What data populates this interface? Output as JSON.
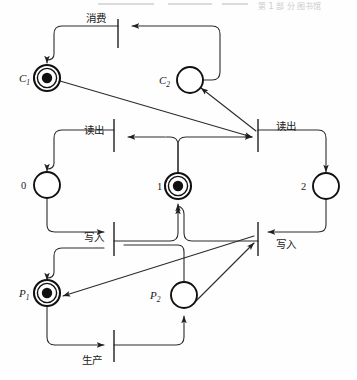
{
  "figure": {
    "type": "petri-net",
    "title": "",
    "colors": {
      "stroke": "#111111",
      "line": "#2b2b2b",
      "background": "#fefefe",
      "token": "#111111"
    }
  },
  "places": [
    {
      "id": "C1",
      "label": "C",
      "subscript": "1",
      "label_side": "left",
      "tokens": 1,
      "style": "double",
      "cx": 47,
      "cy": 78,
      "r": 13
    },
    {
      "id": "C2",
      "label": "C",
      "subscript": "2",
      "label_side": "left",
      "tokens": 0,
      "style": "single",
      "cx": 190,
      "cy": 80,
      "r": 13
    },
    {
      "id": "B0",
      "label": "0",
      "subscript": "",
      "label_side": "left",
      "tokens": 0,
      "style": "single",
      "cx": 47,
      "cy": 185,
      "r": 13
    },
    {
      "id": "B1",
      "label": "1",
      "subscript": "",
      "label_side": "left",
      "tokens": 1,
      "style": "double",
      "cx": 178,
      "cy": 186,
      "r": 13
    },
    {
      "id": "B2",
      "label": "2",
      "subscript": "",
      "label_side": "left",
      "tokens": 0,
      "style": "single",
      "cx": 326,
      "cy": 186,
      "r": 13
    },
    {
      "id": "P1",
      "label": "P",
      "subscript": "1",
      "label_side": "left",
      "tokens": 1,
      "style": "double",
      "cx": 47,
      "cy": 293,
      "r": 13
    },
    {
      "id": "P2",
      "label": "P",
      "subscript": "2",
      "label_side": "left",
      "tokens": 0,
      "style": "single",
      "cx": 184,
      "cy": 295,
      "r": 13
    }
  ],
  "transitions": [
    {
      "id": "t-consume",
      "label": "消费",
      "label_pos": "left-above",
      "x": 118,
      "y_top": 19,
      "y_bottom": 48,
      "label_x": 96,
      "label_y": 22
    },
    {
      "id": "t-read-left",
      "label": "读出",
      "label_pos": "left",
      "x": 114,
      "y_top": 119,
      "y_bottom": 152,
      "label_x": 94,
      "label_y": 133
    },
    {
      "id": "t-read-right",
      "label": "读出",
      "label_pos": "right",
      "x": 258,
      "y_top": 119,
      "y_bottom": 152,
      "label_x": 268,
      "label_y": 129
    },
    {
      "id": "t-write-left",
      "label": "写入",
      "label_pos": "left",
      "x": 114,
      "y_top": 222,
      "y_bottom": 256,
      "label_x": 94,
      "label_y": 240
    },
    {
      "id": "t-write-right",
      "label": "写入",
      "label_pos": "right",
      "x": 258,
      "y_top": 222,
      "y_bottom": 256,
      "label_x": 268,
      "label_y": 247
    },
    {
      "id": "t-produce",
      "label": "生产",
      "label_pos": "left-below",
      "x": 114,
      "y_top": 330,
      "y_bottom": 362,
      "label_x": 92,
      "label_y": 361
    }
  ],
  "arcs": [
    {
      "id": "arc-c2-to-consume",
      "from": "C2",
      "to": "t-consume"
    },
    {
      "id": "arc-consume-to-c1",
      "from": "t-consume",
      "to": "C1"
    },
    {
      "id": "arc-c1-to-readright",
      "from": "C1",
      "to": "t-read-right"
    },
    {
      "id": "arc-readright-to-c2",
      "from": "t-read-right",
      "to": "C2"
    },
    {
      "id": "arc-b1-to-readleft",
      "from": "B1",
      "to": "t-read-left"
    },
    {
      "id": "arc-readleft-to-b0",
      "from": "t-read-left",
      "to": "B0"
    },
    {
      "id": "arc-b1-to-readright-path",
      "from": "B1",
      "to": "t-read-right"
    },
    {
      "id": "arc-readright-to-b2",
      "from": "t-read-right",
      "to": "B2"
    },
    {
      "id": "arc-b0-to-writeleft",
      "from": "B0",
      "to": "t-write-left"
    },
    {
      "id": "arc-writeleft-to-b1",
      "from": "t-write-left",
      "to": "B1"
    },
    {
      "id": "arc-b2-to-writeright",
      "from": "B2",
      "to": "t-write-right"
    },
    {
      "id": "arc-writeright-to-b1",
      "from": "t-write-right",
      "to": "B1"
    },
    {
      "id": "arc-p2-to-writeright",
      "from": "P2",
      "to": "t-write-right"
    },
    {
      "id": "arc-writeright-to-p1",
      "from": "t-write-right",
      "to": "P1"
    },
    {
      "id": "arc-p1-to-produce",
      "from": "P1",
      "to": "t-produce"
    },
    {
      "id": "arc-produce-to-p2",
      "from": "t-produce",
      "to": "P2"
    }
  ],
  "scan_artifacts": {
    "text": "第 1 部 分 图书馆",
    "visible": true
  }
}
